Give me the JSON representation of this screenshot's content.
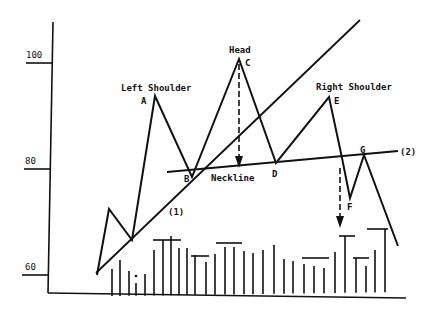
{
  "chart_data": {
    "type": "line",
    "title": "",
    "xlabel": "",
    "ylabel": "",
    "ylim": [
      55,
      110
    ],
    "grid": false,
    "y_ticks": [
      {
        "label": "100",
        "value": 100
      },
      {
        "label": "80",
        "value": 80
      },
      {
        "label": "60",
        "value": 60
      }
    ],
    "annotations": {
      "left_shoulder": "Left Shoulder",
      "head": "Head",
      "right_shoulder": "Right Shoulder",
      "neckline": "Neckline",
      "trendline_1": "(1)",
      "trendline_2": "(2)"
    },
    "price_points": [
      {
        "label": "",
        "x": 97,
        "y": 275
      },
      {
        "label": "",
        "x": 109,
        "y": 209
      },
      {
        "label": "",
        "x": 132,
        "y": 240
      },
      {
        "label": "A",
        "x": 155,
        "y": 96
      },
      {
        "label": "B",
        "x": 192,
        "y": 177
      },
      {
        "label": "C",
        "x": 239,
        "y": 59
      },
      {
        "label": "D",
        "x": 276,
        "y": 163
      },
      {
        "label": "E",
        "x": 329,
        "y": 97
      },
      {
        "label": "",
        "x": 342,
        "y": 158
      },
      {
        "label": "F",
        "x": 350,
        "y": 198
      },
      {
        "label": "G",
        "x": 364,
        "y": 155
      },
      {
        "label": "",
        "x": 398,
        "y": 246
      }
    ],
    "price_series_approx_values": [
      60.5,
      73,
      67,
      94.5,
      79,
      101.5,
      81.5,
      94,
      82.5,
      75,
      83,
      65.5
    ],
    "point_labels": [
      "A",
      "B",
      "C",
      "D",
      "E",
      "F",
      "G"
    ],
    "trendlines": [
      {
        "name": "(1)",
        "from": [
          96,
          273
        ],
        "to": [
          360,
          20
        ]
      },
      {
        "name": "(2)",
        "from": [
          167,
          172
        ],
        "to": [
          398,
          151
        ]
      }
    ],
    "projection_arrows": [
      {
        "from": [
          239,
          64
        ],
        "to": [
          239,
          168
        ]
      },
      {
        "from": [
          340,
          168
        ],
        "to": [
          340,
          228
        ]
      }
    ],
    "volume": {
      "baseline_y": 296,
      "bars": [
        {
          "x": 112,
          "top": 269
        },
        {
          "x": 120,
          "top": 260
        },
        {
          "x": 129,
          "top": 271
        },
        {
          "x": 136,
          "top": 283
        },
        {
          "x": 145,
          "top": 274
        },
        {
          "x": 154,
          "top": 250
        },
        {
          "x": 163,
          "top": 240
        },
        {
          "x": 171,
          "top": 236
        },
        {
          "x": 179,
          "top": 248
        },
        {
          "x": 187,
          "top": 248
        },
        {
          "x": 195,
          "top": 255
        },
        {
          "x": 206,
          "top": 262
        },
        {
          "x": 215,
          "top": 254
        },
        {
          "x": 225,
          "top": 247
        },
        {
          "x": 234,
          "top": 247
        },
        {
          "x": 244,
          "top": 251
        },
        {
          "x": 253,
          "top": 253
        },
        {
          "x": 263,
          "top": 250
        },
        {
          "x": 274,
          "top": 245
        },
        {
          "x": 284,
          "top": 259
        },
        {
          "x": 293,
          "top": 261
        },
        {
          "x": 304,
          "top": 264
        },
        {
          "x": 314,
          "top": 266
        },
        {
          "x": 324,
          "top": 268
        },
        {
          "x": 335,
          "top": 252
        },
        {
          "x": 345,
          "top": 236
        },
        {
          "x": 356,
          "top": 258
        },
        {
          "x": 366,
          "top": 266
        },
        {
          "x": 375,
          "top": 250
        },
        {
          "x": 385,
          "top": 229
        }
      ],
      "caps": [
        {
          "x1": 153,
          "x2": 181,
          "y": 240
        },
        {
          "x1": 191,
          "x2": 209,
          "y": 256
        },
        {
          "x1": 216,
          "x2": 242,
          "y": 243
        },
        {
          "x1": 302,
          "x2": 329,
          "y": 258
        },
        {
          "x1": 339,
          "x2": 355,
          "y": 236
        },
        {
          "x1": 353,
          "x2": 369,
          "y": 258
        },
        {
          "x1": 367,
          "x2": 388,
          "y": 229
        }
      ],
      "dot": {
        "x": 136,
        "y": 276
      }
    }
  }
}
